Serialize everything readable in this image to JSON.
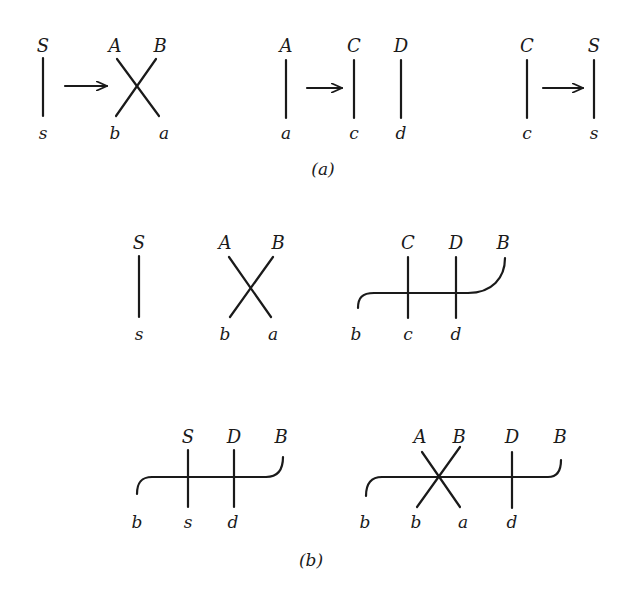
{
  "figure": {
    "part_a": {
      "caption": "(a)",
      "diagrams": [
        {
          "id": "s-to-AB-crossing",
          "top_labels": [
            "S",
            "A",
            "B"
          ],
          "bottom_labels": [
            "s",
            "b",
            "a"
          ],
          "description": "S line arrow to crossing of A,B with b,a"
        },
        {
          "id": "A-to-CD",
          "top_labels": [
            "A",
            "C",
            "D"
          ],
          "bottom_labels": [
            "a",
            "c",
            "d"
          ],
          "description": "A line arrow to parallel C and D lines"
        },
        {
          "id": "C-to-S",
          "top_labels": [
            "C",
            "S"
          ],
          "bottom_labels": [
            "c",
            "s"
          ],
          "description": "C line arrow to S line"
        }
      ]
    },
    "part_b": {
      "caption": "(b)",
      "row1": [
        {
          "id": "S-line",
          "top_labels": [
            "S"
          ],
          "bottom_labels": [
            "s"
          ]
        },
        {
          "id": "AB-crossing",
          "top_labels": [
            "A",
            "B"
          ],
          "bottom_labels": [
            "b",
            "a"
          ]
        },
        {
          "id": "CD-with-B-propagator",
          "top_labels": [
            "C",
            "D",
            "B"
          ],
          "bottom_labels": [
            "b",
            "c",
            "d"
          ]
        }
      ],
      "row2": [
        {
          "id": "SD-with-B-propagator",
          "top_labels": [
            "S",
            "D",
            "B"
          ],
          "bottom_labels": [
            "b",
            "s",
            "d"
          ]
        },
        {
          "id": "AB-crossing-D-with-B-propagator",
          "top_labels": [
            "A",
            "B",
            "D",
            "B"
          ],
          "bottom_labels": [
            "b",
            "b",
            "a",
            "d"
          ]
        }
      ]
    }
  },
  "labels": {
    "a1_S": "S",
    "a1_s": "s",
    "a1_A": "A",
    "a1_B": "B",
    "a1_b": "b",
    "a1_a": "a",
    "a2_A": "A",
    "a2_a": "a",
    "a2_C": "C",
    "a2_c": "c",
    "a2_D": "D",
    "a2_d": "d",
    "a3_C": "C",
    "a3_c": "c",
    "a3_S": "S",
    "a3_s": "s",
    "cap_a": "(a)",
    "b1_S": "S",
    "b1_s": "s",
    "b1_A": "A",
    "b1_B": "B",
    "b1_b": "b",
    "b1_a": "a",
    "b1_C": "C",
    "b1_D": "D",
    "b1_B2": "B",
    "b1_b2": "b",
    "b1_c": "c",
    "b1_d": "d",
    "b2_S": "S",
    "b2_D": "D",
    "b2_B": "B",
    "b2_b": "b",
    "b2_s": "s",
    "b2_d": "d",
    "b2_A": "A",
    "b2_B2": "B",
    "b2_D2": "D",
    "b2_B3": "B",
    "b2_b2": "b",
    "b2_b3": "b",
    "b2_a": "a",
    "b2_d2": "d",
    "cap_b": "(b)"
  }
}
